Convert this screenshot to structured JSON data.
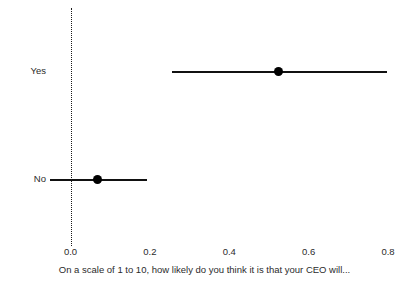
{
  "chart_data": {
    "type": "scatter",
    "title": "",
    "subtitle": "",
    "xlabel": "On a scale of 1 to 10, how likely do you think it is that your CEO will...",
    "ylabel": "Islamic loans?",
    "categories": [
      "No",
      "Yes"
    ],
    "xlim": [
      -0.06,
      0.83
    ],
    "xticks": [
      "0.0",
      "0.2",
      "0.4",
      "0.6",
      "0.8"
    ],
    "xtick_values": [
      0.0,
      0.2,
      0.4,
      0.6,
      0.8
    ],
    "grid": false,
    "legend": "none",
    "reference_line": {
      "value": 0,
      "style": "dotted",
      "orientation": "vertical",
      "color": "#1a1a1a"
    },
    "point_color": "#000000",
    "line_color": "#111111",
    "series": [
      {
        "name": "estimate",
        "points": [
          {
            "category": "Yes",
            "value": 0.525,
            "ci_low": 0.256,
            "ci_high": 0.797
          },
          {
            "category": "No",
            "value": 0.067,
            "ci_low": -0.052,
            "ci_high": 0.193
          }
        ]
      }
    ]
  }
}
